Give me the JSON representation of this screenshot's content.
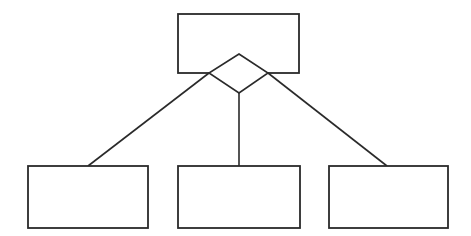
{
  "diagram": {
    "type": "hierarchy",
    "stroke_color": "#2a2a2a",
    "background": "#ffffff",
    "root": {
      "id": "parent",
      "label": "",
      "x": 178,
      "y": 14,
      "w": 121,
      "h": 59
    },
    "connector": {
      "shape": "diamond",
      "top": [
        239,
        54
      ],
      "right": [
        268,
        73
      ],
      "bottom": [
        239,
        93
      ],
      "left": [
        209,
        73
      ]
    },
    "children": [
      {
        "id": "child-1",
        "label": "",
        "x": 28,
        "y": 166,
        "w": 120,
        "h": 62
      },
      {
        "id": "child-2",
        "label": "",
        "x": 178,
        "y": 166,
        "w": 122,
        "h": 62
      },
      {
        "id": "child-3",
        "label": "",
        "x": 329,
        "y": 166,
        "w": 119,
        "h": 62
      }
    ],
    "edges": [
      {
        "from": [
          209,
          73
        ],
        "to": [
          88,
          166
        ]
      },
      {
        "from": [
          239,
          93
        ],
        "to": [
          239,
          166
        ]
      },
      {
        "from": [
          268,
          73
        ],
        "to": [
          387,
          166
        ]
      }
    ]
  }
}
